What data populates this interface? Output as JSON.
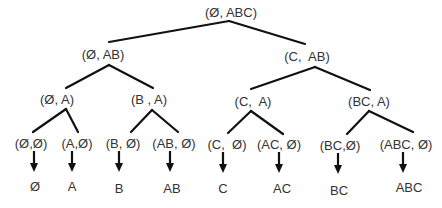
{
  "diagram": {
    "type": "binary-tree",
    "root": {
      "label": "(Ø, ABC)"
    },
    "level1": [
      {
        "label": "(Ø, AB)"
      },
      {
        "label": "(C,  AB)"
      }
    ],
    "level2": [
      {
        "label": "(Ø, A)"
      },
      {
        "label": "(B , A)"
      },
      {
        "label": "(C,  A)"
      },
      {
        "label": "(BC, A)"
      }
    ],
    "level3": [
      {
        "label": "(Ø,Ø)"
      },
      {
        "label": "(A,Ø)"
      },
      {
        "label": "(B, Ø)"
      },
      {
        "label": "(AB, Ø)"
      },
      {
        "label": "(C,  Ø)"
      },
      {
        "label": "(AC, Ø)"
      },
      {
        "label": "(BC,Ø)"
      },
      {
        "label": "(ABC, Ø)"
      }
    ],
    "results": [
      {
        "label": "Ø"
      },
      {
        "label": "A"
      },
      {
        "label": "B"
      },
      {
        "label": "AB"
      },
      {
        "label": "C"
      },
      {
        "label": "AC"
      },
      {
        "label": "BC"
      },
      {
        "label": "ABC"
      }
    ],
    "colors": {
      "line": "#111111",
      "text": "#333333",
      "background": "#ffffff"
    }
  }
}
